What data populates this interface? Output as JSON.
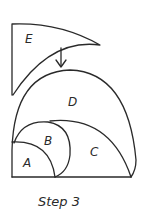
{
  "diagram": {
    "title": "Step 3",
    "caption": "Step 3",
    "shapes": [
      {
        "id": "A",
        "label": "A",
        "description": "small quarter circle at corner"
      },
      {
        "id": "B",
        "label": "B",
        "description": "circle segment above A"
      },
      {
        "id": "C",
        "label": "C",
        "description": "arc region right of B"
      },
      {
        "id": "D",
        "label": "D",
        "description": "large semicircle region"
      },
      {
        "id": "E",
        "label": "E",
        "description": "curved corner piece above D"
      }
    ],
    "arrow": {
      "direction": "down",
      "from": "E",
      "to": "D"
    },
    "colors": {
      "ink": "#2a2a2a",
      "background": "#ffffff"
    }
  }
}
